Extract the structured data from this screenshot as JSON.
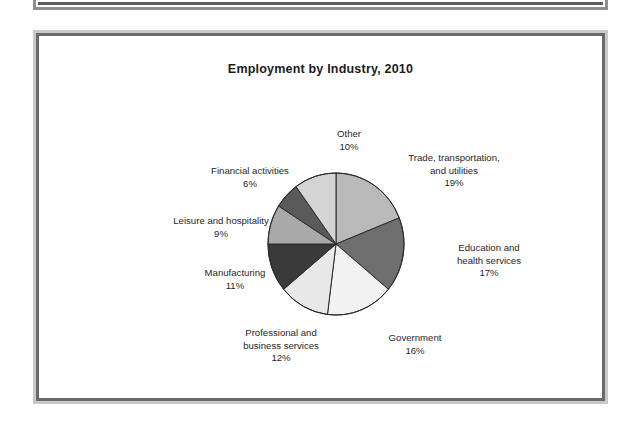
{
  "figure": {
    "title": "Employment by Industry, 2010"
  },
  "chart_data": {
    "type": "pie",
    "title": "Employment by Industry, 2010",
    "xlabel": "",
    "ylabel": "",
    "grid": false,
    "legend_position": "none",
    "label_format": "name above percent, placed outside each slice",
    "start_angle_deg": 0,
    "direction": "clockwise",
    "units": "percent of total employment",
    "total": 100,
    "categories": [
      "Trade, transportation, and utilities",
      "Education and health services",
      "Government",
      "Professional and business services",
      "Manufacturing",
      "Leisure and hospitality",
      "Financial activities",
      "Other"
    ],
    "values": [
      19,
      17,
      16,
      12,
      11,
      9,
      6,
      10
    ],
    "slices": [
      {
        "name": "Trade, transportation, and utilities",
        "label_line1": "Trade, transportation,",
        "label_line2": "and utilities",
        "value": 19,
        "value_label": "19%",
        "color": "#b9b9b9"
      },
      {
        "name": "Education and health services",
        "label_line1": "Education and",
        "label_line2": "health services",
        "value": 17,
        "value_label": "17%",
        "color": "#6e6e6e"
      },
      {
        "name": "Government",
        "label_line1": "Government",
        "label_line2": "",
        "value": 16,
        "value_label": "16%",
        "color": "#f2f2f2"
      },
      {
        "name": "Professional and business services",
        "label_line1": "Professional and",
        "label_line2": "business services",
        "value": 12,
        "value_label": "12%",
        "color": "#e8e8e8"
      },
      {
        "name": "Manufacturing",
        "label_line1": "Manufacturing",
        "label_line2": "",
        "value": 11,
        "value_label": "11%",
        "color": "#3a3a3a"
      },
      {
        "name": "Leisure and hospitality",
        "label_line1": "Leisure and hospitality",
        "label_line2": "",
        "value": 9,
        "value_label": "9%",
        "color": "#a9a9a9"
      },
      {
        "name": "Financial activities",
        "label_line1": "Financial activities",
        "label_line2": "",
        "value": 6,
        "value_label": "6%",
        "color": "#5a5a5a"
      },
      {
        "name": "Other",
        "label_line1": "Other",
        "label_line2": "",
        "value": 10,
        "value_label": "10%",
        "color": "#d4d4d4"
      }
    ]
  },
  "geometry": {
    "cx": 297,
    "cy": 208,
    "rx": 68,
    "ry": 71,
    "stroke": "#2b2b2b",
    "stroke_width": 1
  }
}
